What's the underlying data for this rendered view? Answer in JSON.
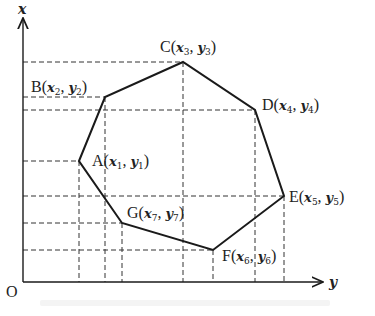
{
  "diagram": {
    "axes": {
      "vertical_label": "x",
      "horizontal_label": "y",
      "origin_label": "O",
      "origin_px": [
        23,
        282
      ],
      "vertical_top_px": 18,
      "horizontal_right_px": 323
    },
    "polygon": {
      "stroke": "#1a1a1a",
      "dash_color": "#333333",
      "vertices": [
        {
          "name": "A",
          "x_var": "x",
          "x_sub": "1",
          "y_var": "y",
          "y_sub": "1",
          "px": [
            79,
            161
          ],
          "label_px": [
            92,
            166
          ]
        },
        {
          "name": "B",
          "x_var": "x",
          "x_sub": "2",
          "y_var": "y",
          "y_sub": "2",
          "px": [
            105,
            97
          ],
          "label_px": [
            31,
            92
          ]
        },
        {
          "name": "C",
          "x_var": "x",
          "x_sub": "3",
          "y_var": "y",
          "y_sub": "3",
          "px": [
            183,
            62
          ],
          "label_px": [
            160,
            52
          ]
        },
        {
          "name": "D",
          "x_var": "x",
          "x_sub": "4",
          "y_var": "y",
          "y_sub": "4",
          "px": [
            255,
            110
          ],
          "label_px": [
            262,
            110
          ]
        },
        {
          "name": "E",
          "x_var": "x",
          "x_sub": "5",
          "y_var": "y",
          "y_sub": "5",
          "px": [
            284,
            196
          ],
          "label_px": [
            289,
            202
          ]
        },
        {
          "name": "F",
          "x_var": "x",
          "x_sub": "6",
          "y_var": "y",
          "y_sub": "6",
          "px": [
            213,
            250
          ],
          "label_px": [
            222,
            261
          ]
        },
        {
          "name": "G",
          "x_var": "x",
          "x_sub": "7",
          "y_var": "y",
          "y_sub": "7",
          "px": [
            122,
            223
          ],
          "label_px": [
            127,
            218
          ]
        }
      ],
      "edge_order": [
        "A",
        "B",
        "C",
        "D",
        "E",
        "F",
        "G"
      ]
    }
  }
}
